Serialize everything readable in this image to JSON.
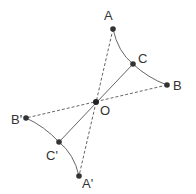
{
  "diagram": {
    "colors": {
      "line": "#666666",
      "point": "#333333",
      "label": "#333333"
    },
    "points": {
      "A": {
        "label": "A",
        "x": 113,
        "y": 29
      },
      "C": {
        "label": "C",
        "x": 133,
        "y": 64
      },
      "B": {
        "label": "B",
        "x": 167,
        "y": 85
      },
      "O": {
        "label": "O",
        "x": 96,
        "y": 102
      },
      "Bp": {
        "label": "B'",
        "x": 26,
        "y": 118
      },
      "Cp": {
        "label": "C'",
        "x": 59,
        "y": 142
      },
      "Ap": {
        "label": "A'",
        "x": 79,
        "y": 176
      }
    },
    "segments": {
      "solid": [
        "C-O",
        "O-C'"
      ],
      "dashed": [
        "A-A'",
        "B-B'"
      ]
    },
    "curves": [
      "A-C-B",
      "B'-C'-A'"
    ]
  }
}
